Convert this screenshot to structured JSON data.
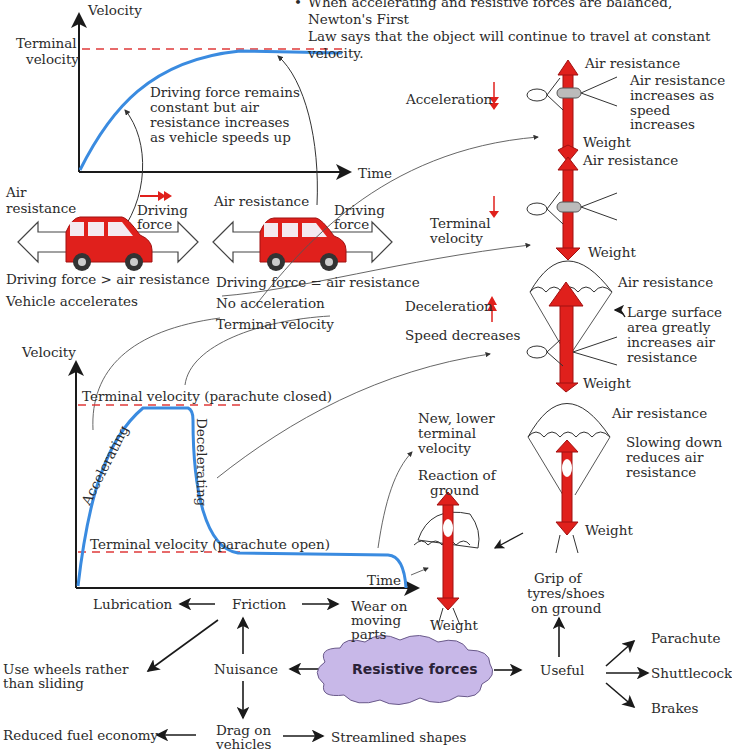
{
  "header": {
    "bullet_line1": "When accelerating and resistive forces are balanced, Newton's First",
    "bullet_line2": "Law says that the object will continue to travel at constant velocity."
  },
  "top_graph": {
    "y_axis_label": "Velocity",
    "x_axis_label": "Time",
    "terminal_label_1": "Terminal",
    "terminal_label_2": "velocity",
    "annotation": [
      "Driving force remains",
      "constant but air",
      "resistance increases",
      "as vehicle speeds up"
    ]
  },
  "cars": {
    "left": {
      "air_resistance_1": "Air",
      "air_resistance_2": "resistance",
      "driving_force_1": "Driving",
      "driving_force_2": "force",
      "caption_1": "Driving force > air resistance",
      "caption_2": "Vehicle accelerates"
    },
    "right": {
      "air_resistance": "Air resistance",
      "driving_force_1": "Driving",
      "driving_force_2": "force",
      "caption_1": "Driving force = air resistance",
      "caption_2": "No acceleration",
      "caption_3": "Terminal velocity"
    }
  },
  "skydiver": {
    "stage1": {
      "label": "Acceleration",
      "up": "Air resistance",
      "note": [
        "Air resistance",
        "increases as",
        "speed",
        "increases"
      ],
      "down": "Weight"
    },
    "stage2": {
      "label_1": "Terminal",
      "label_2": "velocity",
      "up": "Air resistance",
      "down": "Weight"
    },
    "stage3": {
      "label": "Deceleration",
      "label_2": "Speed decreases",
      "up": "Air resistance",
      "note": [
        "Large surface",
        "area greatly",
        "increases air",
        "resistance"
      ],
      "down": "Weight"
    },
    "stage4": {
      "up": "Air resistance",
      "note": [
        "Slowing down",
        "reduces air",
        "resistance"
      ],
      "down": "Weight"
    },
    "landed": {
      "up_1": "Reaction of",
      "up_2": "ground",
      "down": "Weight"
    }
  },
  "bottom_graph": {
    "y_axis_label": "Velocity",
    "x_axis_label": "Time",
    "closed_label": "Terminal velocity (parachute closed)",
    "open_label": "Terminal velocity (parachute open)",
    "accelerating": "Accelerating",
    "decelerating": "Decelerating",
    "new_lower": [
      "New, lower",
      "terminal",
      "velocity"
    ]
  },
  "concept_map": {
    "center": "Resistive forces",
    "nuisance": "Nuisance",
    "useful": "Useful",
    "friction": "Friction",
    "lubrication": "Lubrication",
    "wear": [
      "Wear on",
      "moving",
      "parts"
    ],
    "wheels": [
      "Use wheels rather",
      "than sliding"
    ],
    "drag": [
      "Drag on",
      "vehicles"
    ],
    "fuel": "Reduced fuel economy",
    "streamlined": "Streamlined shapes",
    "grip": [
      "Grip of",
      "tyres/shoes",
      "on ground"
    ],
    "parachute": "Parachute",
    "shuttlecock": "Shuttlecock",
    "brakes": "Brakes"
  },
  "colors": {
    "curve": "#3a8be0",
    "dashed": "#e03a3a",
    "force_arrow": "#e0201c",
    "car": "#e0201c",
    "cloud": "#c8b8e8"
  }
}
